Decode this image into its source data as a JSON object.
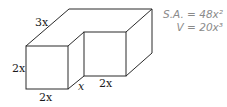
{
  "diagram": {
    "type": "3D L-shaped solid",
    "labels": {
      "top_depth": "3x",
      "front_height": "2x",
      "front_width": "2x",
      "notch_depth": "x",
      "inner_width": "2x"
    },
    "formulas": {
      "surface_area": "S.A. = 48x²",
      "volume": "V = 20x³"
    },
    "colors": {
      "stroke": "#2a2a2a",
      "formula_text": "#8a8a8a"
    }
  }
}
